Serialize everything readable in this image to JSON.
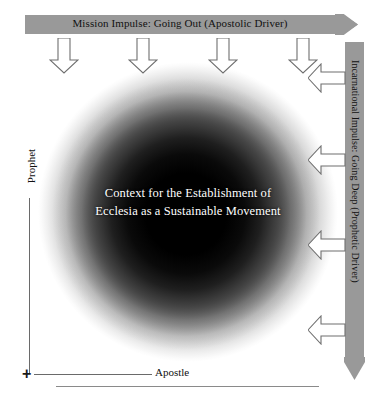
{
  "diagram": {
    "title": "Context for the Establishment of Ecclesia as a Sustainable Movement",
    "top_bar": {
      "label": "Mission Impulse: Going Out  (Apostolic Driver)",
      "direction": "right",
      "color": "#999999"
    },
    "right_bar": {
      "label": "Incarnational Impulse: Going Deep (Prophetic Driver)",
      "direction": "down",
      "color": "#999999"
    },
    "center": {
      "line1": "Context for the Establishment of",
      "line2": "Ecclesia as a Sustainable Movement",
      "text_color": "#ffffff",
      "core_color": "#000000"
    },
    "axes": {
      "y_label": "Prophet",
      "x_label": "Apostle",
      "origin_marker": "+",
      "line_color": "#6a6a6a"
    },
    "down_arrows": [
      {
        "name": "down-arrow-1"
      },
      {
        "name": "down-arrow-2"
      },
      {
        "name": "down-arrow-3"
      },
      {
        "name": "down-arrow-4"
      }
    ],
    "left_arrows": [
      {
        "name": "left-arrow-1"
      },
      {
        "name": "left-arrow-2"
      },
      {
        "name": "left-arrow-3"
      },
      {
        "name": "left-arrow-4"
      }
    ]
  }
}
